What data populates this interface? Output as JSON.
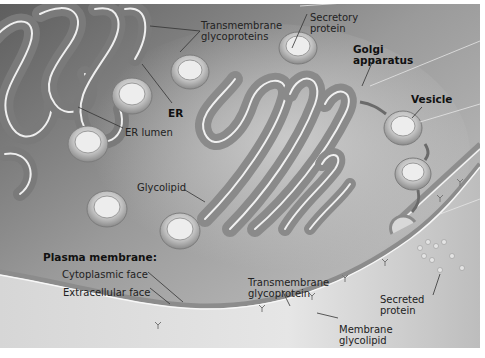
{
  "figure": {
    "colors": {
      "background_dark": "#6f6f6f",
      "background_light": "#d9d9d9",
      "cytoplasm_pale": "#e8e8e8",
      "membrane_highlight": "#f6f6f6",
      "text": "#222222"
    },
    "labels": {
      "transmembrane_glycoproteins": [
        "Transmembrane",
        "glycoproteins"
      ],
      "secretory_protein": [
        "Secretory",
        "protein"
      ],
      "golgi_apparatus": [
        "Golgi",
        "apparatus"
      ],
      "er": "ER",
      "vesicle": "Vesicle",
      "er_lumen": "ER lumen",
      "glycolipid": "Glycolipid",
      "plasma_membrane": "Plasma membrane:",
      "cytoplasmic_face": "Cytoplasmic face",
      "extracellular_face": "Extracellular face",
      "transmembrane_glycoprotein": [
        "Transmembrane",
        "glycoprotein"
      ],
      "secreted_protein": [
        "Secreted",
        "protein"
      ],
      "membrane_glycolipid": [
        "Membrane",
        "glycolipid"
      ]
    }
  }
}
